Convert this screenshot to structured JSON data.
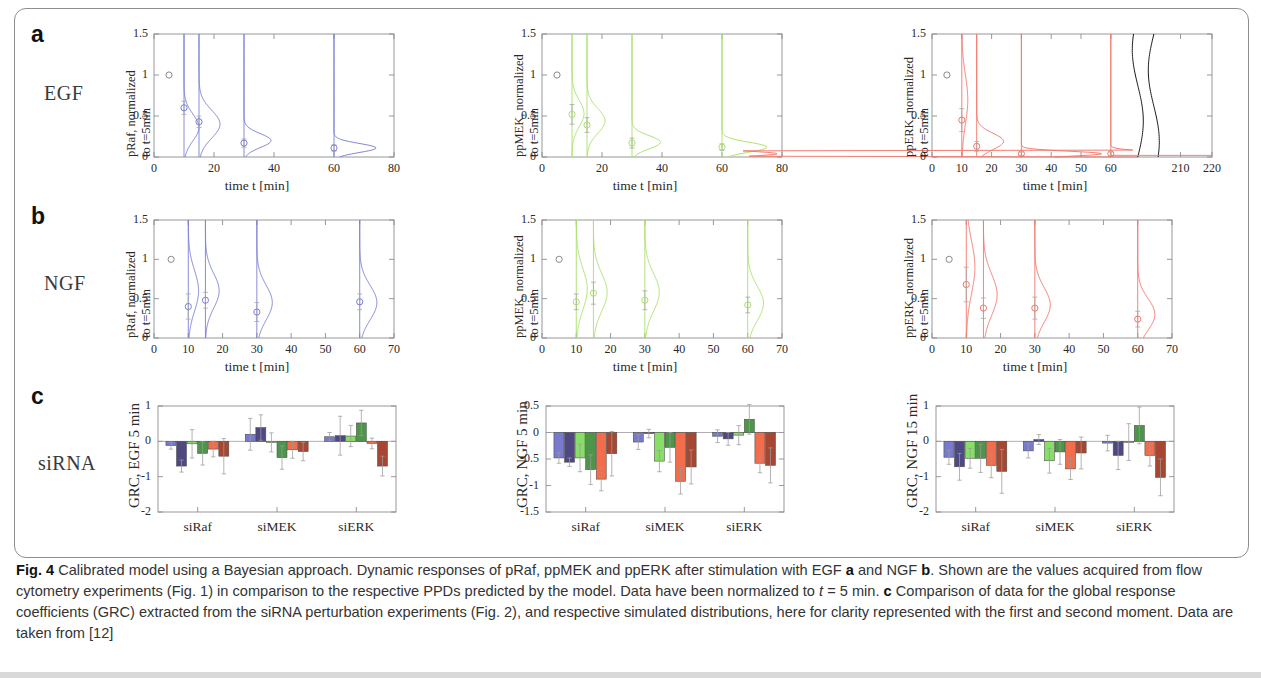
{
  "figure": {
    "panel_letters": {
      "a": "a",
      "b": "b",
      "c": "c"
    },
    "row_labels": {
      "a": "EGF",
      "b": "NGF",
      "c": "siRNA"
    }
  },
  "caption": {
    "label": "Fig. 4",
    "text_1": " Calibrated model using a Bayesian approach. Dynamic responses of pRaf, ppMEK and ppERK after stimulation with EGF ",
    "bold_a": "a",
    "text_2": " and NGF ",
    "bold_b": "b",
    "text_3": ". Shown are the values acquired from flow cytometry experiments (Fig. 1) in comparison to the respective PPDs predicted by the model. Data have been normalized to ",
    "italic_t": "t",
    "text_4": " = 5 min. ",
    "bold_c": "c",
    "text_5": " Comparison of data for the global response coefficients (GRC) extracted from the siRNA perturbation experiments (Fig. 2), and respective simulated distributions, here for clarity represented with the first and second moment. Data are taken from [12]"
  },
  "colors": {
    "blue": "#7b7fd4",
    "green": "#a9e06a",
    "red": "#f3766a",
    "black": "#1a1a1a",
    "bar_light_blue": "#6d6fc9",
    "bar_dark_blue": "#3f3a78",
    "bar_light_green": "#7ddc5a",
    "bar_dark_green": "#3e8c3a",
    "bar_light_red": "#f2603c",
    "bar_dark_red": "#a1371f",
    "axis": "#8d8d8d",
    "error": "#9a9a9a"
  },
  "chart_data": [
    {
      "id": "a1",
      "type": "line",
      "title": "",
      "ylabel_line1": "pRaf, normalized",
      "ylabel_line2": "to t=5min",
      "xlabel": "time t [min]",
      "color": "#7b7fd4",
      "xlim": [
        0,
        80
      ],
      "ylim": [
        0,
        1.5
      ],
      "xticks": [
        0,
        20,
        40,
        60,
        80
      ],
      "yticks": [
        0,
        0.5,
        1,
        1.5
      ],
      "ytick_labels": [
        "0",
        "0.5",
        "1",
        "1.5"
      ],
      "data_points": [
        {
          "x": 5,
          "y": 1.0,
          "err": 0.0
        },
        {
          "x": 10,
          "y": 0.6,
          "err": 0.08
        },
        {
          "x": 15,
          "y": 0.43,
          "err": 0.07
        },
        {
          "x": 30,
          "y": 0.17,
          "err": 0.05
        },
        {
          "x": 60,
          "y": 0.11,
          "err": 0.04
        }
      ],
      "densities": [
        {
          "x": 10,
          "mode": 0.36,
          "peak_w": 5.0,
          "spread": 0.16
        },
        {
          "x": 15,
          "mode": 0.4,
          "peak_w": 7.0,
          "spread": 0.17
        },
        {
          "x": 30,
          "mode": 0.2,
          "peak_w": 9.0,
          "spread": 0.085
        },
        {
          "x": 60,
          "mode": 0.11,
          "peak_w": 14.0,
          "spread": 0.055
        }
      ]
    },
    {
      "id": "a2",
      "type": "line",
      "ylabel_line1": "ppMEK, normalized",
      "ylabel_line2": "to t=5min",
      "xlabel": "time t [min]",
      "color": "#a9e06a",
      "xlim": [
        0,
        80
      ],
      "ylim": [
        0,
        1.5
      ],
      "xticks": [
        0,
        20,
        40,
        60,
        80
      ],
      "yticks": [
        0,
        0.5,
        1,
        1.5
      ],
      "ytick_labels": [
        "0",
        "0.5",
        "1",
        "1.5"
      ],
      "data_points": [
        {
          "x": 5,
          "y": 1.0,
          "err": 0.0
        },
        {
          "x": 10,
          "y": 0.52,
          "err": 0.12
        },
        {
          "x": 15,
          "y": 0.39,
          "err": 0.09
        },
        {
          "x": 30,
          "y": 0.17,
          "err": 0.06
        },
        {
          "x": 60,
          "y": 0.12,
          "err": 0.04
        }
      ],
      "densities": [
        {
          "x": 10,
          "mode": 0.53,
          "peak_w": 4.0,
          "spread": 0.16
        },
        {
          "x": 15,
          "mode": 0.44,
          "peak_w": 6.0,
          "spread": 0.15
        },
        {
          "x": 30,
          "mode": 0.18,
          "peak_w": 9.5,
          "spread": 0.08
        },
        {
          "x": 60,
          "mode": 0.12,
          "peak_w": 15.0,
          "spread": 0.06
        }
      ]
    },
    {
      "id": "a3",
      "type": "line",
      "ylabel_line1": "ppERK, normalized",
      "ylabel_line2": "to t=5min",
      "xlabel": "time t [min]",
      "color": "#f3766a",
      "xlim": [
        0,
        220
      ],
      "ylim": [
        0,
        1.5
      ],
      "xticks": [
        0,
        10,
        20,
        30,
        40,
        50,
        60,
        210,
        220
      ],
      "yticks": [
        0,
        0.5,
        1,
        1.5
      ],
      "ytick_labels": [
        "0",
        "0.5",
        "1",
        "1.5"
      ],
      "axis_break": true,
      "data_points": [
        {
          "x": 5,
          "y": 1.0,
          "err": 0.0
        },
        {
          "x": 10,
          "y": 0.45,
          "err": 0.14
        },
        {
          "x": 15,
          "y": 0.13,
          "err": 0.06
        },
        {
          "x": 30,
          "y": 0.04,
          "err": 0.02
        },
        {
          "x": 60,
          "y": 0.04,
          "err": 0.02
        }
      ],
      "densities": [
        {
          "x": 10,
          "mode": 0.7,
          "peak_w": 2.0,
          "spread": 0.3
        },
        {
          "x": 15,
          "mode": 0.19,
          "peak_w": 9.0,
          "spread": 0.1
        },
        {
          "x": 30,
          "mode": 0.04,
          "peak_w": 27.0,
          "spread": 0.03
        },
        {
          "x": 60,
          "mode": 0.04,
          "peak_w": 22.0,
          "spread": 0.03
        }
      ],
      "black_curves": 2
    },
    {
      "id": "b1",
      "type": "line",
      "ylabel_line1": "pRaf, normalized",
      "ylabel_line2": "to t=5min",
      "xlabel": "time t [min]",
      "color": "#7b7fd4",
      "xlim": [
        0,
        70
      ],
      "ylim": [
        0,
        1.5
      ],
      "xticks": [
        0,
        10,
        20,
        30,
        40,
        50,
        60,
        70
      ],
      "yticks": [
        0,
        0.5,
        1,
        1.5
      ],
      "ytick_labels": [
        "0",
        "0.5",
        "1",
        "1.5"
      ],
      "data_points": [
        {
          "x": 5,
          "y": 1.0,
          "err": 0.0
        },
        {
          "x": 10,
          "y": 0.4,
          "err": 0.16
        },
        {
          "x": 15,
          "y": 0.48,
          "err": 0.1
        },
        {
          "x": 30,
          "y": 0.33,
          "err": 0.12
        },
        {
          "x": 60,
          "y": 0.46,
          "err": 0.1
        }
      ],
      "densities": [
        {
          "x": 10,
          "mode": 0.6,
          "peak_w": 3.0,
          "spread": 0.26
        },
        {
          "x": 15,
          "mode": 0.6,
          "peak_w": 4.0,
          "spread": 0.22
        },
        {
          "x": 30,
          "mode": 0.45,
          "peak_w": 4.5,
          "spread": 0.22
        },
        {
          "x": 60,
          "mode": 0.45,
          "peak_w": 5.0,
          "spread": 0.22
        }
      ]
    },
    {
      "id": "b2",
      "type": "line",
      "ylabel_line1": "ppMEK, normalized",
      "ylabel_line2": "to t=5min",
      "xlabel": "time t [min]",
      "color": "#a9e06a",
      "xlim": [
        0,
        70
      ],
      "ylim": [
        0,
        1.5
      ],
      "xticks": [
        0,
        10,
        20,
        30,
        40,
        50,
        60,
        70
      ],
      "yticks": [
        0,
        0.5,
        1,
        1.5
      ],
      "ytick_labels": [
        "0",
        "0.5",
        "1",
        "1.5"
      ],
      "data_points": [
        {
          "x": 5,
          "y": 1.0,
          "err": 0.0
        },
        {
          "x": 10,
          "y": 0.46,
          "err": 0.1
        },
        {
          "x": 15,
          "y": 0.57,
          "err": 0.14
        },
        {
          "x": 30,
          "y": 0.48,
          "err": 0.12
        },
        {
          "x": 60,
          "y": 0.42,
          "err": 0.1
        }
      ],
      "densities": [
        {
          "x": 10,
          "mode": 0.62,
          "peak_w": 3.2,
          "spread": 0.26
        },
        {
          "x": 15,
          "mode": 0.58,
          "peak_w": 4.0,
          "spread": 0.24
        },
        {
          "x": 30,
          "mode": 0.58,
          "peak_w": 4.2,
          "spread": 0.24
        },
        {
          "x": 60,
          "mode": 0.44,
          "peak_w": 4.6,
          "spread": 0.22
        }
      ]
    },
    {
      "id": "b3",
      "type": "line",
      "ylabel_line1": "ppERK, normalized",
      "ylabel_line2": "to t=5min",
      "xlabel": "time t [min]",
      "color": "#f3766a",
      "xlim": [
        0,
        70
      ],
      "ylim": [
        0,
        1.5
      ],
      "xticks": [
        0,
        10,
        20,
        30,
        40,
        50,
        60,
        70
      ],
      "yticks": [
        0,
        0.5,
        1,
        1.5
      ],
      "ytick_labels": [
        "0",
        "0.5",
        "1",
        "1.5"
      ],
      "data_points": [
        {
          "x": 5,
          "y": 1.0,
          "err": 0.0
        },
        {
          "x": 10,
          "y": 0.68,
          "err": 0.22
        },
        {
          "x": 15,
          "y": 0.38,
          "err": 0.13
        },
        {
          "x": 30,
          "y": 0.38,
          "err": 0.14
        },
        {
          "x": 60,
          "y": 0.24,
          "err": 0.1
        }
      ],
      "densities": [
        {
          "x": 10,
          "mode": 0.9,
          "peak_w": 2.5,
          "spread": 0.34
        },
        {
          "x": 15,
          "mode": 0.55,
          "peak_w": 4.0,
          "spread": 0.26
        },
        {
          "x": 30,
          "mode": 0.42,
          "peak_w": 4.5,
          "spread": 0.22
        },
        {
          "x": 60,
          "mode": 0.3,
          "peak_w": 5.0,
          "spread": 0.2
        }
      ]
    },
    {
      "id": "c1",
      "type": "bar",
      "ylabel": "GRC, EGF 5 min",
      "xlabel": "",
      "categories": [
        "siRaf",
        "siMEK",
        "siERK"
      ],
      "ylim": [
        -2,
        1
      ],
      "yticks": [
        -2,
        -1,
        0,
        1
      ],
      "ytick_labels": [
        "-2",
        "-1",
        "0",
        "1"
      ],
      "series": [
        {
          "name": "pRaf data",
          "color": "#6d6fc9",
          "values": [
            -0.12,
            0.2,
            0.13
          ]
        },
        {
          "name": "pRaf model",
          "color": "#3f3a78",
          "values": [
            -0.7,
            0.39,
            0.16
          ]
        },
        {
          "name": "ppMEK data",
          "color": "#7ddc5a",
          "values": [
            -0.07,
            -0.03,
            0.15
          ]
        },
        {
          "name": "ppMEK model",
          "color": "#3e8c3a",
          "values": [
            -0.34,
            -0.46,
            0.52
          ]
        },
        {
          "name": "ppERK data",
          "color": "#f2603c",
          "values": [
            -0.22,
            -0.24,
            -0.06
          ]
        },
        {
          "name": "ppERK model",
          "color": "#a1371f",
          "values": [
            -0.42,
            -0.29,
            -0.7
          ]
        }
      ],
      "errors": [
        [
          0.1,
          0.17,
          0.4,
          0.33,
          0.22,
          0.5
        ],
        [
          0.45,
          0.36,
          0.27,
          0.33,
          0.24,
          0.26
        ],
        [
          0.12,
          0.55,
          0.3,
          0.36,
          0.15,
          0.28
        ]
      ]
    },
    {
      "id": "c2",
      "type": "bar",
      "ylabel": "GRC, NGF 5 min",
      "xlabel": "",
      "categories": [
        "siRaf",
        "siMEK",
        "siERK"
      ],
      "ylim": [
        -1.5,
        0.5
      ],
      "yticks": [
        -1.5,
        -1,
        -0.5,
        0,
        0.5
      ],
      "ytick_labels": [
        "-1.5",
        "-1",
        "-0.5",
        "0",
        "0.5"
      ],
      "series": [
        {
          "name": "pRaf data",
          "color": "#6d6fc9",
          "values": [
            -0.48,
            -0.18,
            -0.07
          ]
        },
        {
          "name": "pRaf model",
          "color": "#3f3a78",
          "values": [
            -0.56,
            -0.02,
            -0.12
          ]
        },
        {
          "name": "ppMEK data",
          "color": "#7ddc5a",
          "values": [
            -0.48,
            -0.54,
            -0.05
          ]
        },
        {
          "name": "ppMEK model",
          "color": "#3e8c3a",
          "values": [
            -0.7,
            -0.28,
            0.25
          ]
        },
        {
          "name": "ppERK data",
          "color": "#f2603c",
          "values": [
            -0.88,
            -0.92,
            -0.58
          ]
        },
        {
          "name": "ppERK model",
          "color": "#a1371f",
          "values": [
            -0.4,
            -0.65,
            -0.62
          ]
        }
      ],
      "errors": [
        [
          0.1,
          0.08,
          0.26,
          0.28,
          0.22,
          0.42
        ],
        [
          0.14,
          0.08,
          0.2,
          0.28,
          0.24,
          0.32
        ],
        [
          0.12,
          0.12,
          0.18,
          0.28,
          0.18,
          0.33
        ]
      ]
    },
    {
      "id": "c3",
      "type": "bar",
      "ylabel": "GRC, NGF 15 min",
      "xlabel": "",
      "categories": [
        "siRaf",
        "siMEK",
        "siERK"
      ],
      "ylim": [
        -2,
        1
      ],
      "yticks": [
        -2,
        -1,
        0,
        1
      ],
      "ytick_labels": [
        "-2",
        "-1",
        "0",
        "1"
      ],
      "series": [
        {
          "name": "pRaf data",
          "color": "#6d6fc9",
          "values": [
            -0.45,
            -0.27,
            -0.05
          ]
        },
        {
          "name": "pRaf model",
          "color": "#3f3a78",
          "values": [
            -0.72,
            0.05,
            -0.4
          ]
        },
        {
          "name": "ppMEK data",
          "color": "#7ddc5a",
          "values": [
            -0.48,
            -0.55,
            -0.02
          ]
        },
        {
          "name": "ppMEK model",
          "color": "#3e8c3a",
          "values": [
            -0.48,
            -0.3,
            0.45
          ]
        },
        {
          "name": "ppERK data",
          "color": "#f2603c",
          "values": [
            -0.68,
            -0.78,
            -0.4
          ]
        },
        {
          "name": "ppERK model",
          "color": "#a1371f",
          "values": [
            -0.85,
            -0.33,
            -1.02
          ]
        }
      ],
      "errors": [
        [
          0.2,
          0.38,
          0.28,
          0.4,
          0.35,
          0.62
        ],
        [
          0.2,
          0.14,
          0.35,
          0.35,
          0.3,
          0.45
        ],
        [
          0.22,
          0.4,
          0.52,
          0.52,
          0.3,
          0.52
        ]
      ]
    }
  ]
}
